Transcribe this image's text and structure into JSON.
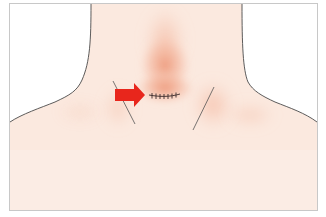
{
  "figure": {
    "colors": {
      "background": "#ffffff",
      "skin": "#fbe9df",
      "skin_light": "#fcefe8",
      "blush": "#f0a789",
      "blush_strong": "#eb8f6e",
      "outline": "#4a4a4a",
      "frame": "#c8c8c8",
      "arrow": "#e8261c",
      "suture": "#3a2a2a"
    },
    "elements": {
      "arrow": {
        "direction": "right",
        "icon": "arrow-right-icon"
      },
      "incision": {
        "type": "sutured-horizontal",
        "stitch_count": 7
      },
      "muscle_lines": [
        "left-sternocleidomastoid-line",
        "right-sternocleidomastoid-line"
      ]
    }
  }
}
